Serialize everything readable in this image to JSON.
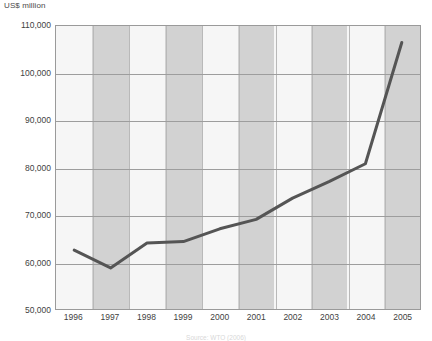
{
  "chart_data": {
    "type": "line",
    "title": "",
    "subtitle": "",
    "xlabel": "",
    "ylabel": "US$ million",
    "unit_label": "US$ million",
    "categories": [
      "1996",
      "1997",
      "1998",
      "1999",
      "2000",
      "2001",
      "2002",
      "2003",
      "2004",
      "2005"
    ],
    "x": [
      1996,
      1997,
      1998,
      1999,
      2000,
      2001,
      2002,
      2003,
      2004,
      2005
    ],
    "values": [
      62500,
      58700,
      64000,
      64300,
      67000,
      69000,
      73500,
      77000,
      80800,
      106500
    ],
    "series": [
      {
        "name": "Value",
        "values": [
          62500,
          58700,
          64000,
          64300,
          67000,
          69000,
          73500,
          77000,
          80800,
          106500
        ],
        "color": "#555555"
      }
    ],
    "ylim": [
      50000,
      110000
    ],
    "ytick_step": 10000,
    "ytick_labels": [
      "110,000",
      "100,000",
      "90,000",
      "80,000",
      "70,000",
      "60,000",
      "50,000"
    ],
    "ytick_values": [
      110000,
      100000,
      90000,
      80000,
      70000,
      60000,
      50000
    ],
    "grid": "horizontal",
    "legend": "none",
    "band_colors": [
      "#f6f6f6",
      "#d2d2d2"
    ],
    "line_color": "#555555",
    "line_width": 3,
    "axis_color": "#9a9a9a",
    "source_note": "Source: WTO (2006)"
  }
}
